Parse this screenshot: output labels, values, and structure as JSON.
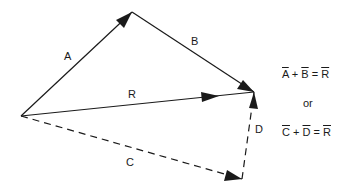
{
  "diagram": {
    "vectors": [
      {
        "name": "A",
        "from": [
          21,
          116
        ],
        "to": [
          132,
          12
        ],
        "style": "solid"
      },
      {
        "name": "B",
        "from": [
          132,
          12
        ],
        "to": [
          254,
          92
        ],
        "style": "solid"
      },
      {
        "name": "R",
        "from": [
          21,
          116
        ],
        "to": [
          254,
          92
        ],
        "style": "solid",
        "arrow_mid": true
      },
      {
        "name": "C",
        "from": [
          21,
          116
        ],
        "to": [
          242,
          179
        ],
        "style": "dashed"
      },
      {
        "name": "D",
        "from": [
          242,
          179
        ],
        "to": [
          254,
          92
        ],
        "style": "dashed"
      }
    ],
    "labels": {
      "a": "A",
      "b": "B",
      "r": "R",
      "c": "C",
      "d": "D"
    },
    "equations": {
      "eq1": {
        "t1": "A",
        "op1": "+",
        "t2": "B",
        "op2": "=",
        "t3": "R"
      },
      "or": "or",
      "eq2": {
        "t1": "C",
        "op1": "+",
        "t2": "D",
        "op2": "=",
        "t3": "R"
      }
    },
    "colors": {
      "line": "#1a1a1a",
      "background": "#ffffff"
    }
  }
}
